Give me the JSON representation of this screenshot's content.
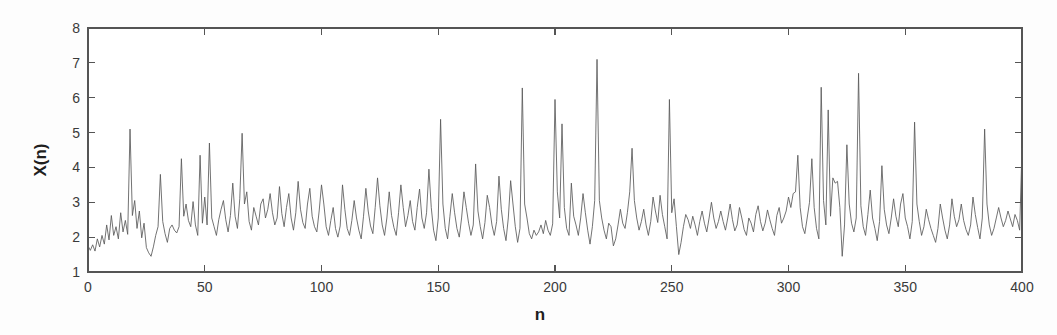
{
  "chart_data": {
    "type": "line",
    "title": "",
    "subtitle": "",
    "xlabel": "n",
    "ylabel": "X(n)",
    "xlim": [
      0,
      400
    ],
    "ylim": [
      1,
      8
    ],
    "xticks": [
      0,
      50,
      100,
      150,
      200,
      250,
      300,
      350,
      400
    ],
    "xticklabels": [
      "0",
      "50",
      "100",
      "150",
      "200",
      "250",
      "300",
      "350",
      "400"
    ],
    "yticks": [
      1,
      2,
      3,
      4,
      5,
      6,
      7,
      8
    ],
    "yticklabels": [
      "1",
      "2",
      "3",
      "4",
      "5",
      "6",
      "7",
      "8"
    ],
    "grid": false,
    "legend": null,
    "line_color": "#5a5a5a",
    "background_color": "#fdfdfd",
    "axis_color": "#555555",
    "series": [
      {
        "name": "X(n)",
        "x_start": 0,
        "x_step": 1,
        "values": [
          1.75,
          1.62,
          1.78,
          1.6,
          1.95,
          1.72,
          2.05,
          1.8,
          2.35,
          1.92,
          2.62,
          2.05,
          2.3,
          1.95,
          2.7,
          2.15,
          2.48,
          2.08,
          5.1,
          2.62,
          3.05,
          2.25,
          2.75,
          1.98,
          2.4,
          1.7,
          1.55,
          1.45,
          1.72,
          2.05,
          2.3,
          3.8,
          2.45,
          2.1,
          1.85,
          2.25,
          2.35,
          2.2,
          2.12,
          2.3,
          4.25,
          2.6,
          2.95,
          2.48,
          2.3,
          3.02,
          2.35,
          2.05,
          4.35,
          2.4,
          3.15,
          2.35,
          4.7,
          2.55,
          2.3,
          2.05,
          2.5,
          2.8,
          3.05,
          2.5,
          2.15,
          2.62,
          3.55,
          2.6,
          2.25,
          3.1,
          4.98,
          2.95,
          3.3,
          2.45,
          2.2,
          2.85,
          2.6,
          2.35,
          2.95,
          3.1,
          2.55,
          2.8,
          3.25,
          2.7,
          2.35,
          2.55,
          3.45,
          2.68,
          2.3,
          2.85,
          3.25,
          2.55,
          2.2,
          2.7,
          3.6,
          2.8,
          2.42,
          2.25,
          2.95,
          3.4,
          2.6,
          2.3,
          2.15,
          2.75,
          3.5,
          2.95,
          2.3,
          2.05,
          2.48,
          2.85,
          2.25,
          2.0,
          2.32,
          3.5,
          2.8,
          2.25,
          2.05,
          2.48,
          3.05,
          2.55,
          2.2,
          1.95,
          2.6,
          3.4,
          2.75,
          2.32,
          2.1,
          2.85,
          3.7,
          2.9,
          2.35,
          2.05,
          2.55,
          3.3,
          2.62,
          2.28,
          2.05,
          2.7,
          3.5,
          2.85,
          2.3,
          2.62,
          3.05,
          2.45,
          2.2,
          2.85,
          3.38,
          2.55,
          2.25,
          2.7,
          3.95,
          2.85,
          2.2,
          1.9,
          2.55,
          5.38,
          2.95,
          2.25,
          1.95,
          2.6,
          3.25,
          2.7,
          2.25,
          2.0,
          2.55,
          3.3,
          2.85,
          2.4,
          2.05,
          2.35,
          4.1,
          2.75,
          2.3,
          1.95,
          2.42,
          3.2,
          2.85,
          2.35,
          2.05,
          2.45,
          3.75,
          2.8,
          2.25,
          1.9,
          2.55,
          3.62,
          2.95,
          2.3,
          1.85,
          2.25,
          6.28,
          2.95,
          2.55,
          2.1,
          1.95,
          2.2,
          2.05,
          2.15,
          2.35,
          2.1,
          2.48,
          2.2,
          2.05,
          2.38,
          5.95,
          3.3,
          2.55,
          5.25,
          2.85,
          2.25,
          2.05,
          3.55,
          2.6,
          2.35,
          2.05,
          2.55,
          3.25,
          2.7,
          2.2,
          1.8,
          2.3,
          3.05,
          7.1,
          3.05,
          2.55,
          2.2,
          1.95,
          2.4,
          2.3,
          1.75,
          1.95,
          2.35,
          2.8,
          2.4,
          2.25,
          2.7,
          3.3,
          4.55,
          3.05,
          2.55,
          2.2,
          2.45,
          2.8,
          2.35,
          2.05,
          2.45,
          3.15,
          2.75,
          2.42,
          3.2,
          2.65,
          2.3,
          1.95,
          5.95,
          2.7,
          3.1,
          2.3,
          1.5,
          1.85,
          2.3,
          2.65,
          2.5,
          2.25,
          2.6,
          2.35,
          2.05,
          2.45,
          2.75,
          2.4,
          2.15,
          2.55,
          3.0,
          2.55,
          2.25,
          2.45,
          2.75,
          2.45,
          2.2,
          2.55,
          2.95,
          2.5,
          2.18,
          2.35,
          2.85,
          2.55,
          2.22,
          2.05,
          2.55,
          2.4,
          2.15,
          2.65,
          2.9,
          2.45,
          2.18,
          2.4,
          2.78,
          2.5,
          2.25,
          2.05,
          2.62,
          2.85,
          2.4,
          2.55,
          2.75,
          3.15,
          2.85,
          3.25,
          3.3,
          4.35,
          2.85,
          2.3,
          2.1,
          2.55,
          3.0,
          4.25,
          2.85,
          2.25,
          1.95,
          6.3,
          3.05,
          2.35,
          5.65,
          2.6,
          3.7,
          3.55,
          3.6,
          2.85,
          1.45,
          2.35,
          4.65,
          2.95,
          2.4,
          2.15,
          2.55,
          6.7,
          2.9,
          2.3,
          2.05,
          2.65,
          3.35,
          2.55,
          2.25,
          1.9,
          2.45,
          4.05,
          2.8,
          2.35,
          2.1,
          2.55,
          3.1,
          2.6,
          2.3,
          2.95,
          3.25,
          2.55,
          2.3,
          1.95,
          2.45,
          5.3,
          2.95,
          2.45,
          2.05,
          2.3,
          2.8,
          2.5,
          2.25,
          2.05,
          1.85,
          2.25,
          2.95,
          2.55,
          2.2,
          1.95,
          2.35,
          3.1,
          2.6,
          2.3,
          2.5,
          2.95,
          2.48,
          2.22,
          2.05,
          2.35,
          3.15,
          2.65,
          2.28,
          1.95,
          2.55,
          5.1,
          2.95,
          2.35,
          2.05,
          2.25,
          2.55,
          2.85,
          2.55,
          2.3,
          2.48,
          2.75,
          2.52,
          2.3,
          2.65,
          2.48,
          2.2,
          4.55
        ]
      }
    ]
  },
  "axis": {
    "ylabel_text": "X(n)",
    "xlabel_text": "n"
  }
}
